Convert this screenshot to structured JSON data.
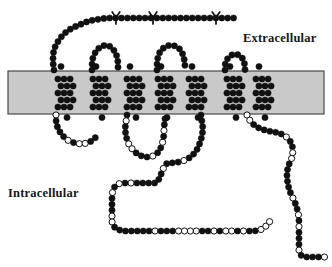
{
  "figure": {
    "type": "membrane-protein-topology"
  },
  "labels": {
    "extracellular": "Extracellular",
    "intracellular": "Intracellular"
  },
  "colors": {
    "membrane_fill": "#c9c9c9",
    "membrane_stroke": "#4a4a4a",
    "residue_filled": "#111111",
    "residue_open_fill": "#ffffff",
    "residue_stroke": "#111111",
    "text": "#171717",
    "background": "#ffffff"
  },
  "membrane": {
    "x": 8,
    "y": 71,
    "width": 316,
    "height": 43
  },
  "residue": {
    "radius": 3.1,
    "spacing": 5.9,
    "open_stroke_width": 1.0
  },
  "glycosylation_sites": [
    {
      "x": 116,
      "y": 14
    },
    {
      "x": 153,
      "y": 14
    },
    {
      "x": 216,
      "y": 14
    }
  ],
  "chart_data": {
    "type": "diagram",
    "helices_count": 7,
    "helix_columns": [
      {
        "id": "TM1",
        "cx": 64
      },
      {
        "id": "TM2",
        "cx": 99
      },
      {
        "id": "TM3",
        "cx": 133
      },
      {
        "id": "TM4",
        "cx": 164
      },
      {
        "id": "TM5",
        "cx": 195
      },
      {
        "id": "TM6",
        "cx": 233
      },
      {
        "id": "TM7",
        "cx": 262
      }
    ],
    "helix_rows_y": [
      79,
      86,
      93,
      100,
      107
    ],
    "chains": [
      {
        "id": "n-terminal-extracellular",
        "side": "extracellular",
        "points": "54,70 53,63 53,56 54,49 57,43 61,37 66,32 72,28 79,25 86,22 93,20 100,19 107,18 114,18 121,18 128,18 135,18 142,18 149,18 156,18 163,18 170,18 177,18 184,18 191,18 198,18 205,18 212,18 219,18 226,18 233,18 239,18"
      },
      {
        "id": "el1",
        "side": "extracellular",
        "points": "92,70 92,63 93,57 96,51 100,47 105,45 110,46 114,50 117,56 118,62 118,69"
      },
      {
        "id": "el2",
        "side": "extracellular",
        "points": "157,70 157,63 158,56 161,50 166,46 172,45 178,47 182,52 184,58 185,65 185,70"
      },
      {
        "id": "el3",
        "side": "extracellular",
        "points": "225,70 225,64 227,59 231,55 236,54 241,56 244,61 245,67 245,70"
      },
      {
        "id": "il1",
        "side": "intracellular",
        "points": "56,115 56,122 58,129 62,135 67,140 74,143 81,144 88,143 93,140 97,136"
      },
      {
        "id": "il2",
        "side": "intracellular",
        "points": "127,115 126,122 125,129 126,136 128,143 132,149 137,154 144,157 151,157 157,154 161,148 163,141 164,134 164,127 165,120 165,115"
      },
      {
        "id": "il3-long",
        "side": "intracellular",
        "points": "201,115 202,122 203,129 202,136 200,143 197,150 192,156 186,160 179,162 172,163 165,163 158,183 151,183 144,183 137,183 130,183 123,183 117,184 113,189 112,196 112,203 112,210 112,217 112,224 116,229 123,231 130,231 137,231 144,231 151,231 158,231 165,231 172,231 179,231 186,231 193,231 200,231 207,231 214,231 221,231 228,231 235,231 242,231 249,231 256,231 263,229 268,224 272,218"
      },
      {
        "id": "c-terminal",
        "side": "intracellular",
        "points": "247,115 250,121 255,126 261,129 268,131 275,132 282,134 288,138 292,144 293,151 292,158 289,164 287,171 287,178 288,185 290,192 293,198 296,205 298,212 299,219 299,226 299,233 299,240 299,247 299,254 304,257 311,257 318,257 325,257"
      }
    ]
  }
}
